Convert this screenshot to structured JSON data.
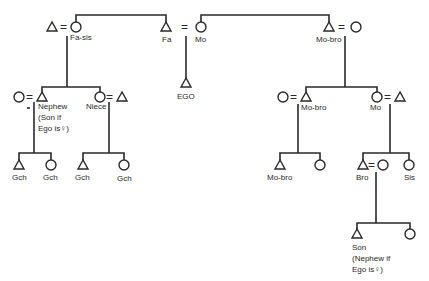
{
  "diagram": {
    "type": "kinship-chart",
    "colors": {
      "ink": "#2a2a2a",
      "background": "#ffffff"
    },
    "symbols": {
      "male": "triangle",
      "female": "circle",
      "marriage": "="
    },
    "labels": {
      "fa_sis": "Fa-sis",
      "fa": "Fa",
      "mo": "Mo",
      "mo_bro_top": "Mo-bro",
      "ego": "EGO",
      "nephew_1": "Nephew",
      "nephew_2": "(Son if",
      "nephew_3": "Ego is♀)",
      "niece": "Niece",
      "mo_bro_mid": "Mo-bro",
      "mo_mid": "Mo",
      "gch_1": "Gch",
      "gch_2": "Gch",
      "gch_3": "Gch",
      "gch_4": "Gch",
      "mo_bro_low": "Mo-bro",
      "bro": "Bro",
      "sis": "Sis",
      "son_1": "Son",
      "son_2": "(Nephew if",
      "son_3": "Ego is♀)"
    },
    "marriage_sign": "="
  }
}
